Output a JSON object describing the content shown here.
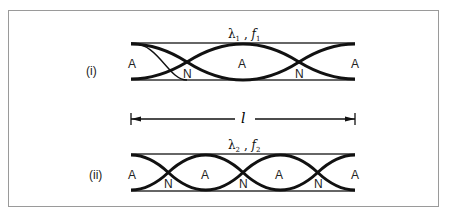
{
  "figure": {
    "case_i": {
      "label": "(i)",
      "wavelength_symbol": "λ",
      "wavelength_sub": "1",
      "freq_symbol": "f",
      "freq_sub": "1",
      "separator": " , ",
      "loops": 2,
      "antinodes": [
        "A",
        "A",
        "A"
      ],
      "nodes": [
        "N",
        "N"
      ]
    },
    "case_ii": {
      "label": "(ii)",
      "wavelength_symbol": "λ",
      "wavelength_sub": "2",
      "freq_symbol": "f",
      "freq_sub": "2",
      "separator": " , ",
      "loops": 3,
      "antinodes": [
        "A",
        "A",
        "A",
        "A"
      ],
      "nodes": [
        "N",
        "N",
        "N"
      ]
    },
    "length_label": "l"
  }
}
